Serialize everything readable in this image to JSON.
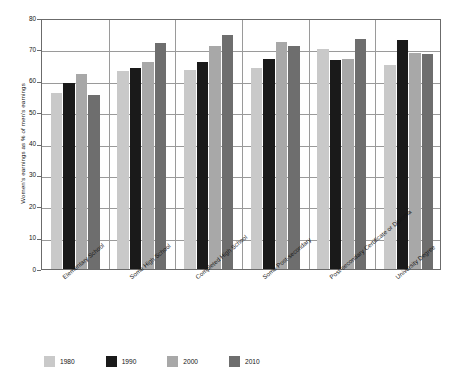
{
  "chart_data": {
    "type": "bar",
    "title": "",
    "subtitle": "",
    "xlabel": "",
    "ylabel": "Women's earnings as % of men's earnings",
    "ylim": [
      0,
      80
    ],
    "ytick_step": 10,
    "yticks": [
      "0",
      "10",
      "20",
      "30",
      "40",
      "50",
      "60",
      "70",
      "80"
    ],
    "grid": true,
    "legend_position": "bottom-left",
    "categories": [
      "Elementary School",
      "Some High School",
      "Completed High School",
      "Some Post-secondary",
      "Post-secondary Certificate or Diploma",
      "University Degree"
    ],
    "series": [
      {
        "name": "1980",
        "color": "#c9c9c9",
        "values": [
          56.0,
          63.0,
          63.5,
          64.0,
          70.0,
          65.0
        ]
      },
      {
        "name": "1990",
        "color": "#1a1a1a",
        "values": [
          59.2,
          64.0,
          66.0,
          67.0,
          66.5,
          73.0
        ]
      },
      {
        "name": "2000",
        "color": "#a8a8a8",
        "values": [
          62.0,
          66.0,
          71.0,
          72.5,
          67.0,
          69.0
        ]
      },
      {
        "name": "2010",
        "color": "#6e6e6e",
        "values": [
          55.5,
          72.0,
          74.5,
          71.0,
          73.2,
          68.5
        ]
      }
    ]
  },
  "legend": {
    "items": [
      {
        "label": "1980",
        "color": "#c9c9c9"
      },
      {
        "label": "1990",
        "color": "#1a1a1a"
      },
      {
        "label": "2000",
        "color": "#a8a8a8"
      },
      {
        "label": "2010",
        "color": "#6e6e6e"
      }
    ]
  },
  "axis": {
    "frame_color": "#6b6b6b",
    "grid_color": "#9a9a9a"
  }
}
